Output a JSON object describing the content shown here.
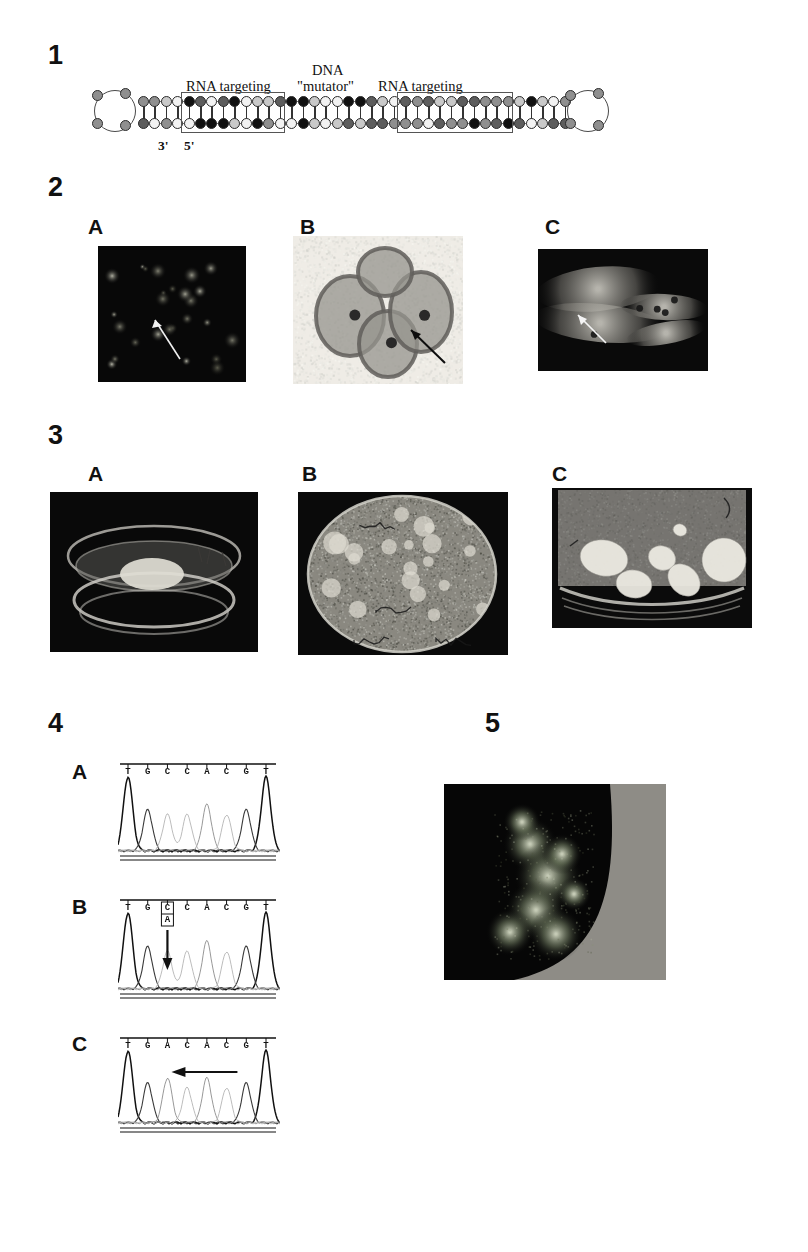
{
  "page": {
    "width": 808,
    "height": 1252,
    "background": "#ffffff",
    "type": "journal-figure-plate"
  },
  "figures": [
    {
      "number": "1",
      "type": "schematic-diagram",
      "title": "chimeric RNA-DNA oligonucleotide duplex",
      "annotations": {
        "left_region": "RNA targeting",
        "center_region_line1": "DNA",
        "center_region_line2": "\"mutator\"",
        "right_region": "RNA targeting",
        "end_label_3prime": "3'",
        "end_label_5prime": "5'"
      },
      "bead_colors": {
        "black": "#111111",
        "dark_gray": "#5d5d5d",
        "mid_gray": "#8f8f8f",
        "light_gray": "#c9c9c9",
        "white": "#f2f2f2"
      }
    },
    {
      "number": "2",
      "type": "micrograph-set",
      "panels": [
        {
          "label": "A",
          "description": "dark-field fluorescent nuclei with white arrow",
          "arrow": "white-arrow",
          "background": "#0a0a0a"
        },
        {
          "label": "B",
          "description": "light-field stained protoplasts with black arrow",
          "arrow": "black-arrow",
          "background": "#eceae4"
        },
        {
          "label": "C",
          "description": "dark-field elongated cells with white arrow",
          "arrow": "white-arrow",
          "background": "#0b0b0b"
        }
      ]
    },
    {
      "number": "3",
      "type": "photograph-set",
      "panels": [
        {
          "label": "A",
          "description": "petri dish with single callus disc",
          "background": "#090909"
        },
        {
          "label": "B",
          "description": "petri dish with dense callus culture and hand-written labels",
          "background": "#0a0a0a"
        },
        {
          "label": "C",
          "description": "petri dish with several pale callus colonies",
          "background": "#0a0a0a"
        }
      ]
    },
    {
      "number": "4",
      "type": "sequencing-chromatogram-set",
      "panels": [
        {
          "label": "A",
          "sequence": [
            "T",
            "G",
            "C",
            "C",
            "A",
            "C",
            "G",
            "T"
          ],
          "variant": null,
          "arrow": null,
          "caption": "wild-type sequence"
        },
        {
          "label": "B",
          "sequence": [
            "T",
            "G",
            "C",
            "C",
            "A",
            "C",
            "G",
            "T"
          ],
          "variant": {
            "position": 2,
            "top_base": "C",
            "bottom_base": "A",
            "boxed": true
          },
          "arrow": "down-arrow",
          "caption": "heterozygous C/A"
        },
        {
          "label": "C",
          "sequence": [
            "T",
            "G",
            "A",
            "C",
            "A",
            "C",
            "G",
            "T"
          ],
          "variant": {
            "position": 2,
            "top_base": "A",
            "bottom_base": null,
            "boxed": false
          },
          "arrow": "left-arrow",
          "caption": "homozygous A mutation"
        }
      ]
    },
    {
      "number": "5",
      "type": "fluorescence-micrograph",
      "description": "dark-field image of fluorescing callus clusters beside a pale plate edge",
      "background": "#060606"
    }
  ]
}
